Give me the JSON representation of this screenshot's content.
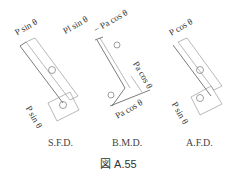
{
  "figure_caption": "図 A.55",
  "panels": {
    "sfd": {
      "caption": "S.F.D.",
      "label_top": "P sin θ",
      "label_bottom": "P sin θ",
      "sign_upper": "+",
      "sign_lower": "−"
    },
    "bmd": {
      "caption": "B.M.D.",
      "label_top_left": "Pl sin θ",
      "label_top_right": "− Pa cos θ",
      "label_right": "Pa cos θ",
      "label_bottom": "Pa cos θ",
      "sign_upper": "−",
      "sign_lower": "+"
    },
    "afd": {
      "caption": "A.F.D.",
      "label_top": "P cos θ",
      "label_bottom": "P sin θ",
      "sign_upper": "+",
      "sign_lower": "+"
    }
  }
}
